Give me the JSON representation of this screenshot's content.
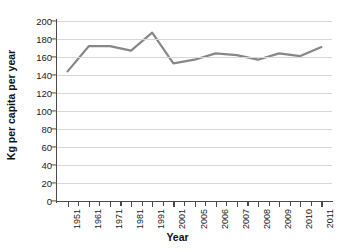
{
  "chart_data": {
    "type": "line",
    "title": "",
    "xlabel": "Year",
    "ylabel": "Kg per capita per year",
    "ylim": [
      0,
      200
    ],
    "ytick_labels": [
      "200",
      "180",
      "160",
      "140",
      "120",
      "100",
      "80",
      "60",
      "40",
      "20",
      "0"
    ],
    "ytick_values": [
      200,
      180,
      160,
      140,
      120,
      100,
      80,
      60,
      40,
      20,
      0
    ],
    "grid": true,
    "legend": "none",
    "line_color": "#878787",
    "categories": [
      "1951",
      "1961",
      "1971",
      "1981",
      "1991",
      "2001",
      "2005",
      "2006",
      "2007",
      "2008",
      "2009",
      "2010",
      "2011"
    ],
    "values": [
      144,
      172,
      172,
      167,
      187,
      153,
      157,
      164,
      162,
      157,
      164,
      161,
      171
    ],
    "series": [
      {
        "name": "Kg per capita per year",
        "values": [
          144,
          172,
          172,
          167,
          187,
          153,
          157,
          164,
          162,
          157,
          164,
          161,
          171
        ]
      }
    ]
  },
  "axes": {
    "y_title": "Kg per capita per year",
    "x_title": "Year"
  }
}
